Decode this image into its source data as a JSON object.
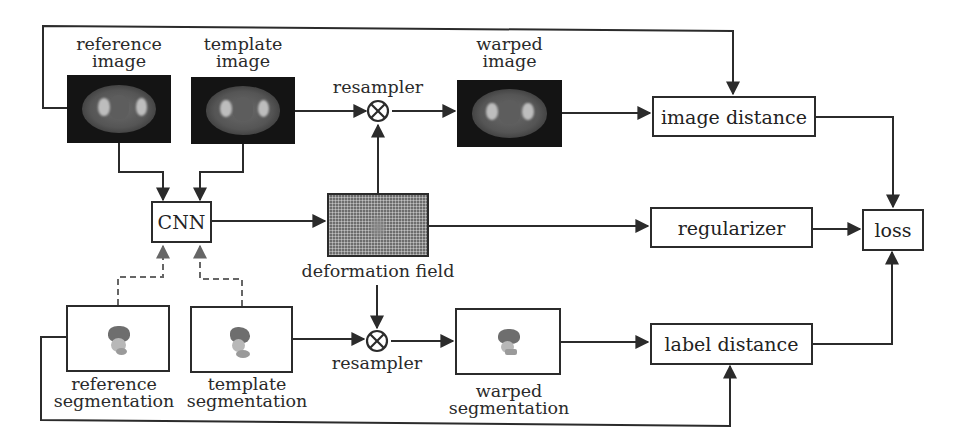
{
  "diagram": {
    "inputs": {
      "reference_image": {
        "label_line1": "reference",
        "label_line2": "image"
      },
      "template_image": {
        "label_line1": "template",
        "label_line2": "image"
      },
      "reference_segmentation": {
        "label_line1": "reference",
        "label_line2": "segmentation"
      },
      "template_segmentation": {
        "label_line1": "template",
        "label_line2": "segmentation"
      }
    },
    "nodes": {
      "cnn": "CNN",
      "deformation_field": "deformation field",
      "resampler_top": "resampler",
      "resampler_bottom": "resampler",
      "warped_image": {
        "label_line1": "warped",
        "label_line2": "image"
      },
      "warped_segmentation": {
        "label_line1": "warped",
        "label_line2": "segmentation"
      },
      "image_distance": "image distance",
      "regularizer": "regularizer",
      "label_distance": "label distance",
      "loss": "loss"
    },
    "edges": [
      {
        "from": "reference image",
        "to": "CNN",
        "style": "solid"
      },
      {
        "from": "template image",
        "to": "CNN",
        "style": "solid"
      },
      {
        "from": "reference segmentation",
        "to": "CNN",
        "style": "dashed"
      },
      {
        "from": "template segmentation",
        "to": "CNN",
        "style": "dashed"
      },
      {
        "from": "CNN",
        "to": "deformation field",
        "style": "solid"
      },
      {
        "from": "template image",
        "to": "resampler (top)",
        "style": "solid"
      },
      {
        "from": "deformation field",
        "to": "resampler (top)",
        "style": "solid"
      },
      {
        "from": "resampler (top)",
        "to": "warped image",
        "style": "solid"
      },
      {
        "from": "warped image",
        "to": "image distance",
        "style": "solid"
      },
      {
        "from": "reference image",
        "to": "image distance",
        "style": "solid"
      },
      {
        "from": "deformation field",
        "to": "regularizer",
        "style": "solid"
      },
      {
        "from": "template segmentation",
        "to": "resampler (bottom)",
        "style": "solid"
      },
      {
        "from": "deformation field",
        "to": "resampler (bottom)",
        "style": "solid"
      },
      {
        "from": "resampler (bottom)",
        "to": "warped segmentation",
        "style": "solid"
      },
      {
        "from": "warped segmentation",
        "to": "label distance",
        "style": "solid"
      },
      {
        "from": "reference segmentation",
        "to": "label distance",
        "style": "solid"
      },
      {
        "from": "image distance",
        "to": "loss",
        "style": "solid"
      },
      {
        "from": "regularizer",
        "to": "loss",
        "style": "solid"
      },
      {
        "from": "label distance",
        "to": "loss",
        "style": "solid"
      }
    ],
    "colors": {
      "line": "#2b2b2b",
      "dashed_line": "#666666",
      "image_background": "#141414",
      "segmentation_dark": "#6e6e6e",
      "segmentation_light": "#b8b8b8"
    }
  }
}
